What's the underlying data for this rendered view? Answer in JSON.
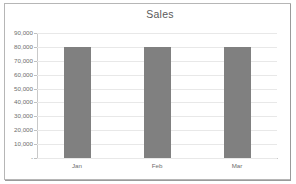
{
  "chart_data": {
    "type": "bar",
    "title": "Sales",
    "categories": [
      "Jan",
      "Feb",
      "Mar"
    ],
    "values": [
      80000,
      80000,
      80000
    ],
    "series": [
      {
        "name": "Sales",
        "values": [
          80000,
          80000,
          80000
        ]
      }
    ],
    "xlabel": "",
    "ylabel": "",
    "ylim": [
      0,
      90000
    ],
    "ytick_step": 10000,
    "ytick_labels": [
      "90,000",
      "80,000",
      "70,000",
      "60,000",
      "50,000",
      "40,000",
      "30,000",
      "20,000",
      "10,000",
      "-"
    ],
    "ytick_values": [
      90000,
      80000,
      70000,
      60000,
      50000,
      40000,
      30000,
      20000,
      10000,
      0
    ],
    "grid": true,
    "legend": false,
    "bar_color": "#808080",
    "gridline_color": "#e8e8e8",
    "axis_color": "#c9c9c9",
    "text_color": "#6e6e6e",
    "border_color": "#b6b6b6",
    "background": "#ffffff"
  }
}
